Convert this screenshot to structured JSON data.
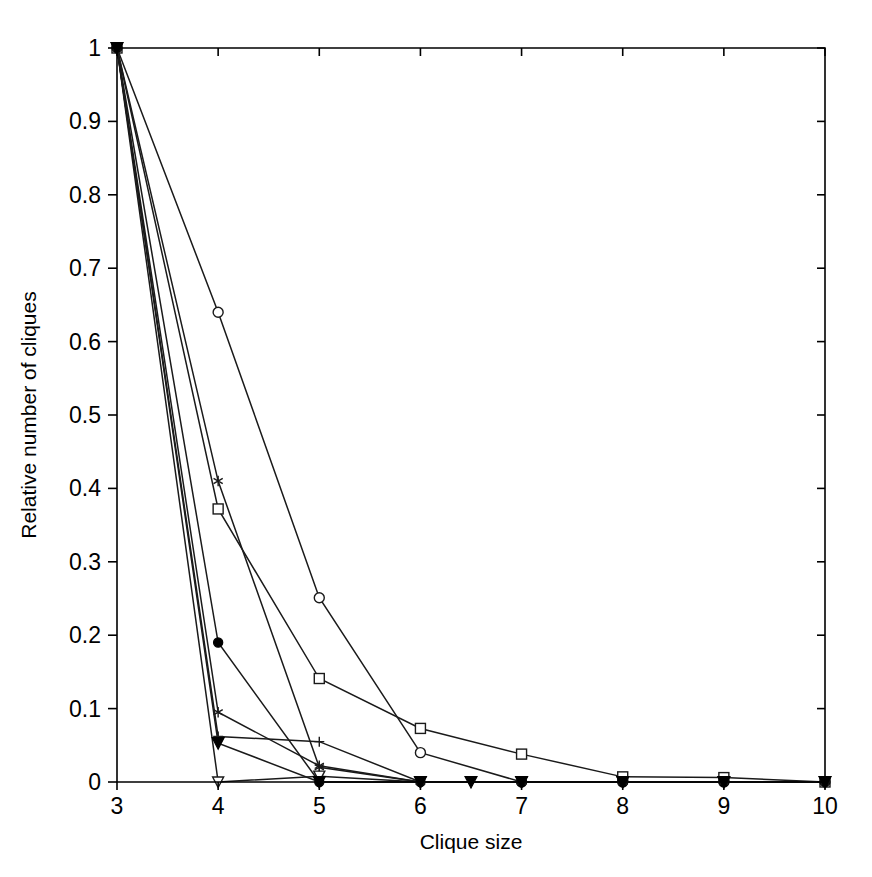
{
  "figure": {
    "background_color": "#ffffff",
    "line_color": "#1a1a1a",
    "axis_color": "#000000"
  },
  "chart_data": {
    "type": "line",
    "title": "",
    "subtitle": "",
    "xlabel": "Clique size",
    "ylabel": "Relative number of cliques",
    "xlim": [
      3,
      10
    ],
    "ylim": [
      0,
      1
    ],
    "xticks": [
      3,
      4,
      5,
      6,
      7,
      8,
      9,
      10
    ],
    "xtick_labels": [
      "3",
      "4",
      "5",
      "6",
      "7",
      "8",
      "9",
      "10"
    ],
    "yticks": [
      0,
      0.1,
      0.2,
      0.3,
      0.4,
      0.5,
      0.6,
      0.7,
      0.8,
      0.9,
      1
    ],
    "ytick_labels": [
      "0",
      "0.1",
      "0.2",
      "0.3",
      "0.4",
      "0.5",
      "0.6",
      "0.7",
      "0.8",
      "0.9",
      "1"
    ],
    "grid": false,
    "legend": "none",
    "legend_position": "none",
    "box_frame": true,
    "tick_direction": "out",
    "series": [
      {
        "name": "series-1",
        "marker": "open-circle",
        "x": [
          3,
          4,
          5,
          6,
          7,
          8,
          9,
          10
        ],
        "values": [
          1.0,
          0.64,
          0.251,
          0.04,
          0.0,
          0.0,
          0.0,
          0.0
        ]
      },
      {
        "name": "series-2",
        "marker": "open-square",
        "x": [
          3,
          4,
          5,
          6,
          7,
          8,
          9,
          10
        ],
        "values": [
          1.0,
          0.372,
          0.141,
          0.073,
          0.038,
          0.007,
          0.006,
          0.0
        ]
      },
      {
        "name": "series-3",
        "marker": "star",
        "x": [
          3,
          4,
          5,
          6,
          7,
          8,
          9,
          10
        ],
        "values": [
          1.0,
          0.41,
          0.02,
          0.0,
          0.0,
          0.0,
          0.0,
          0.0
        ]
      },
      {
        "name": "series-4",
        "marker": "filled-circle",
        "x": [
          3,
          4,
          5,
          6,
          7,
          8,
          9,
          10
        ],
        "values": [
          1.0,
          0.19,
          0.0,
          0.0,
          0.0,
          0.0,
          0.0,
          0.0
        ]
      },
      {
        "name": "series-5",
        "marker": "asterisk",
        "x": [
          3,
          4,
          5,
          6,
          7,
          8,
          9,
          10
        ],
        "values": [
          1.0,
          0.095,
          0.022,
          0.0,
          0.0,
          0.0,
          0.0,
          0.0
        ]
      },
      {
        "name": "series-6",
        "marker": "plus",
        "x": [
          3,
          4,
          5,
          6,
          7,
          8,
          9,
          10
        ],
        "values": [
          1.0,
          0.062,
          0.055,
          0.0,
          0.0,
          0.0,
          0.0,
          0.0
        ]
      },
      {
        "name": "series-7",
        "marker": "open-triangle-down",
        "x": [
          3,
          4,
          5,
          6,
          7,
          8,
          9,
          10
        ],
        "values": [
          1.0,
          0.0,
          0.008,
          0.0,
          0.0,
          0.0,
          0.0,
          0.0
        ]
      },
      {
        "name": "series-8",
        "marker": "filled-triangle-down",
        "x": [
          3,
          4,
          5,
          6,
          6.5,
          7,
          8,
          9,
          10
        ],
        "values": [
          1.0,
          0.053,
          0.0,
          0.0,
          0.0,
          0.0,
          0.0,
          0.0,
          0.0
        ]
      }
    ]
  }
}
